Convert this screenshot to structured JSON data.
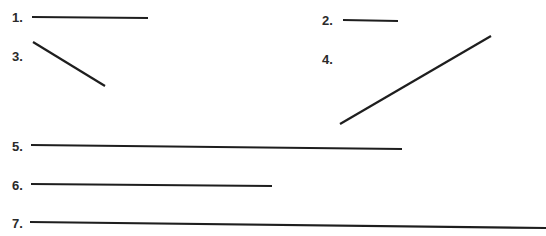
{
  "items": [
    {
      "label": "1.",
      "lx": 12,
      "ly": 11,
      "x1": 32,
      "y1": 17,
      "x2": 148,
      "y2": 18
    },
    {
      "label": "2.",
      "lx": 322,
      "ly": 14,
      "x1": 343,
      "y1": 20,
      "x2": 398,
      "y2": 21
    },
    {
      "label": "3.",
      "lx": 12,
      "ly": 50,
      "x1": 33,
      "y1": 42,
      "x2": 105,
      "y2": 86
    },
    {
      "label": "4.",
      "lx": 322,
      "ly": 53,
      "x1": 340,
      "y1": 124,
      "x2": 491,
      "y2": 36
    },
    {
      "label": "5.",
      "lx": 12,
      "ly": 140,
      "x1": 31,
      "y1": 145,
      "x2": 402,
      "y2": 149
    },
    {
      "label": "6.",
      "lx": 12,
      "ly": 179,
      "x1": 31,
      "y1": 184,
      "x2": 272,
      "y2": 186
    },
    {
      "label": "7.",
      "lx": 12,
      "ly": 217,
      "x1": 30,
      "y1": 222,
      "x2": 546,
      "y2": 228
    }
  ],
  "style": {
    "stroke": "#1e1e1e",
    "stroke_width": 2.2
  }
}
